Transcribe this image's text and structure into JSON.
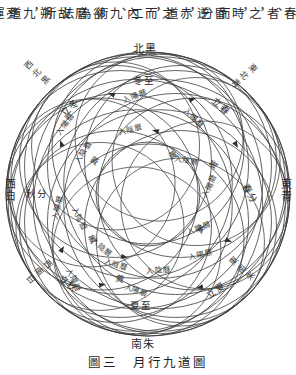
{
  "page": {
    "background_color": "#ffffff",
    "ink_color": "#2d2d2d"
  },
  "body_text": {
    "note": "vertical right-to-left classical Chinese columns, clipped by top edge",
    "columns": [
      "春\n、",
      "者\n，",
      "之\n，",
      "時\n而",
      "昏\n分",
      "逆\n，",
      "赤\n道",
      "之\n，",
      "而\n二",
      "內\n、",
      "九\n術",
      "卻\n為",
      "曆\n法",
      "故\n所",
      "朔\n，",
      "九\n道",
      "亮\n運"
    ]
  },
  "diagram": {
    "title": "月行九道圖",
    "cardinals": [
      {
        "name": "north",
        "text": "北黑",
        "color_word": "黑"
      },
      {
        "name": "south",
        "text": "南朱",
        "color_word": "朱"
      },
      {
        "name": "east",
        "text": "東青",
        "color_word": "青"
      },
      {
        "name": "west",
        "text": "西白",
        "color_word": "白"
      }
    ],
    "arc_directions": [
      {
        "name": "northwest",
        "text": "西北黑"
      },
      {
        "name": "northeast",
        "text": "東北青"
      },
      {
        "name": "southwest",
        "text": "西南白"
      },
      {
        "name": "southeast",
        "text": "東南朱"
      }
    ],
    "solar_terms": [
      {
        "name": "winter-solstice",
        "text": "冬至"
      },
      {
        "name": "summer-solstice",
        "text": "夏至"
      },
      {
        "name": "start-of-winter",
        "text": "立冬"
      },
      {
        "name": "start-of-spring",
        "text": "立春"
      },
      {
        "name": "start-of-summer",
        "text": "立夏"
      },
      {
        "name": "start-of-autumn",
        "text": "立秋"
      },
      {
        "name": "autumn-equinox",
        "text": "秋分"
      },
      {
        "name": "spring-equinox",
        "text": "春分"
      }
    ],
    "annotations": {
      "yang_calendar": "入陽曆",
      "yin_calendar": "入陰曆",
      "yellow_path": "黃"
    }
  },
  "caption": {
    "figure_number": "圖三",
    "figure_title": "月行九道圖",
    "full": "圖三　月行九道圖"
  }
}
